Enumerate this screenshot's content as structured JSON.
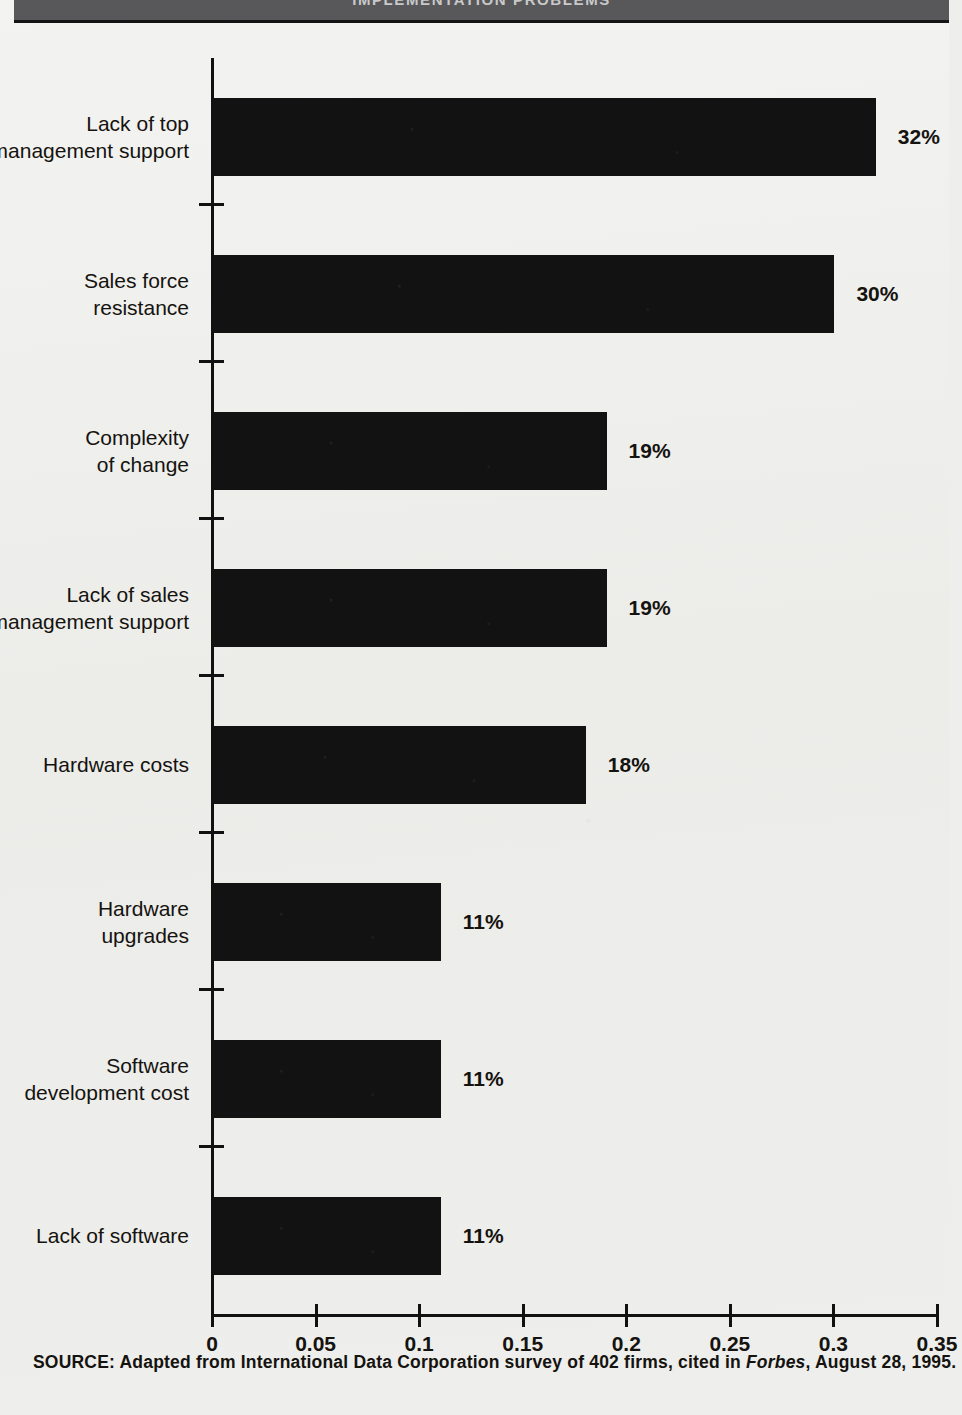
{
  "header": {
    "title": "IMPLEMENTATION PROBLEMS",
    "band_color": "#58585a"
  },
  "source": {
    "prefix": "SOURCE: Adapted from International Data Corporation survey of 402 firms, cited in ",
    "italic": "Forbes",
    "suffix": ", August 28, 1995."
  },
  "chart_data": {
    "type": "bar",
    "orientation": "horizontal",
    "title": "IMPLEMENTATION PROBLEMS",
    "xlabel": "",
    "ylabel": "",
    "xlim": [
      0,
      0.35
    ],
    "grid": false,
    "legend": false,
    "bar_color": "#121212",
    "tick_labels": [
      "0",
      "0.05",
      "0.1",
      "0.15",
      "0.2",
      "0.25",
      "0.3",
      "0.35"
    ],
    "tick_values": [
      0,
      0.05,
      0.1,
      0.15,
      0.2,
      0.25,
      0.3,
      0.35
    ],
    "categories": [
      "Lack of top management support",
      "Sales force resistance",
      "Complexity of change",
      "Lack of sales management support",
      "Hardware costs",
      "Hardware upgrades",
      "Software development cost",
      "Lack of software"
    ],
    "category_lines": [
      [
        "Lack of top",
        "management support"
      ],
      [
        "Sales force",
        "resistance"
      ],
      [
        "Complexity",
        "of change"
      ],
      [
        "Lack of sales",
        "management support"
      ],
      [
        "Hardware costs"
      ],
      [
        "Hardware",
        "upgrades"
      ],
      [
        "Software",
        "development cost"
      ],
      [
        "Lack of software"
      ]
    ],
    "values": [
      0.32,
      0.3,
      0.19,
      0.19,
      0.18,
      0.11,
      0.11,
      0.11
    ],
    "data_labels": [
      "32%",
      "30%",
      "19%",
      "19%",
      "18%",
      "11%",
      "11%",
      "11%"
    ]
  }
}
